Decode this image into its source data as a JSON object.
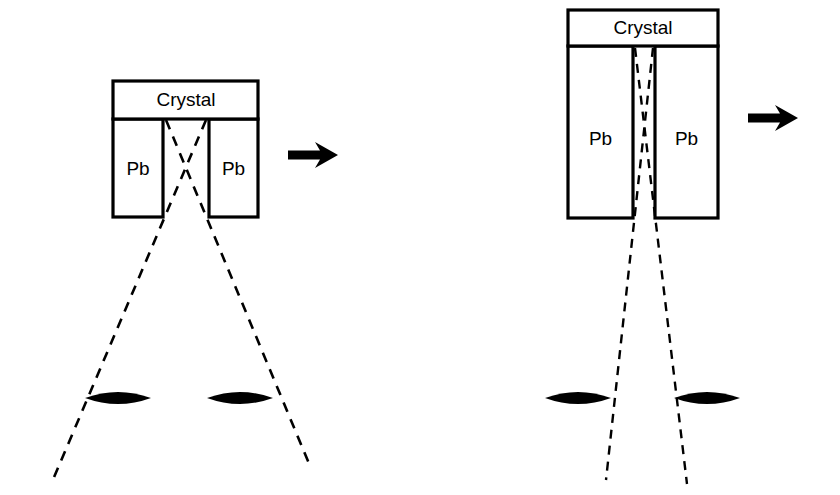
{
  "figure": {
    "background_color": "#ffffff",
    "ink_color": "#000000",
    "width": 840,
    "height": 495
  },
  "panels": [
    {
      "id": "left-panel",
      "name": "wide-gap-collimator",
      "crystal": {
        "label": "Crystal",
        "x": 113,
        "y": 81,
        "width": 145,
        "height": 38
      },
      "shields": [
        {
          "label": "Pb",
          "x": 113,
          "y": 119,
          "width": 50,
          "height": 98
        },
        {
          "label": "Pb",
          "x": 209,
          "y": 119,
          "width": 49,
          "height": 98
        }
      ],
      "gap": {
        "left": 163,
        "right": 209,
        "top": 119,
        "bottom": 217
      },
      "rays": [
        {
          "name": "ray-left-to-right",
          "x1": 166,
          "y1": 120,
          "x2": 310,
          "y2": 466
        },
        {
          "name": "ray-right-to-left",
          "x1": 206,
          "y1": 120,
          "x2": 52,
          "y2": 482
        }
      ],
      "sources": [
        {
          "name": "source-left",
          "cx": 118,
          "cy": 398,
          "rx": 33,
          "ry": 10
        },
        {
          "name": "source-right",
          "cx": 240,
          "cy": 398,
          "rx": 33,
          "ry": 10
        }
      ],
      "arrow": {
        "name": "motion-arrow",
        "x": 288,
        "y": 155,
        "length": 48
      }
    },
    {
      "id": "right-panel",
      "name": "narrow-gap-collimator",
      "crystal": {
        "label": "Crystal",
        "x": 568,
        "y": 10,
        "width": 150,
        "height": 36
      },
      "shields": [
        {
          "label": "Pb",
          "x": 568,
          "y": 46,
          "width": 65,
          "height": 172
        },
        {
          "label": "Pb",
          "x": 655,
          "y": 46,
          "width": 63,
          "height": 172
        }
      ],
      "gap": {
        "left": 633,
        "right": 655,
        "top": 46,
        "bottom": 218
      },
      "rays": [
        {
          "name": "ray-left-to-right",
          "x1": 635,
          "y1": 48,
          "x2": 687,
          "y2": 484
        },
        {
          "name": "ray-right-to-left",
          "x1": 653,
          "y1": 48,
          "x2": 606,
          "y2": 480
        }
      ],
      "sources": [
        {
          "name": "source-left",
          "cx": 578,
          "cy": 398,
          "rx": 33,
          "ry": 10
        },
        {
          "name": "source-right",
          "cx": 707,
          "cy": 398,
          "rx": 33,
          "ry": 10
        }
      ],
      "arrow": {
        "name": "motion-arrow",
        "x": 748,
        "y": 118,
        "length": 48
      }
    }
  ],
  "labels": {
    "crystal": "Crystal",
    "lead_shield": "Pb"
  },
  "icons": {
    "arrow": "arrow-right-icon",
    "source": "radiation-source-icon",
    "ray": "dashed-ray-line"
  }
}
